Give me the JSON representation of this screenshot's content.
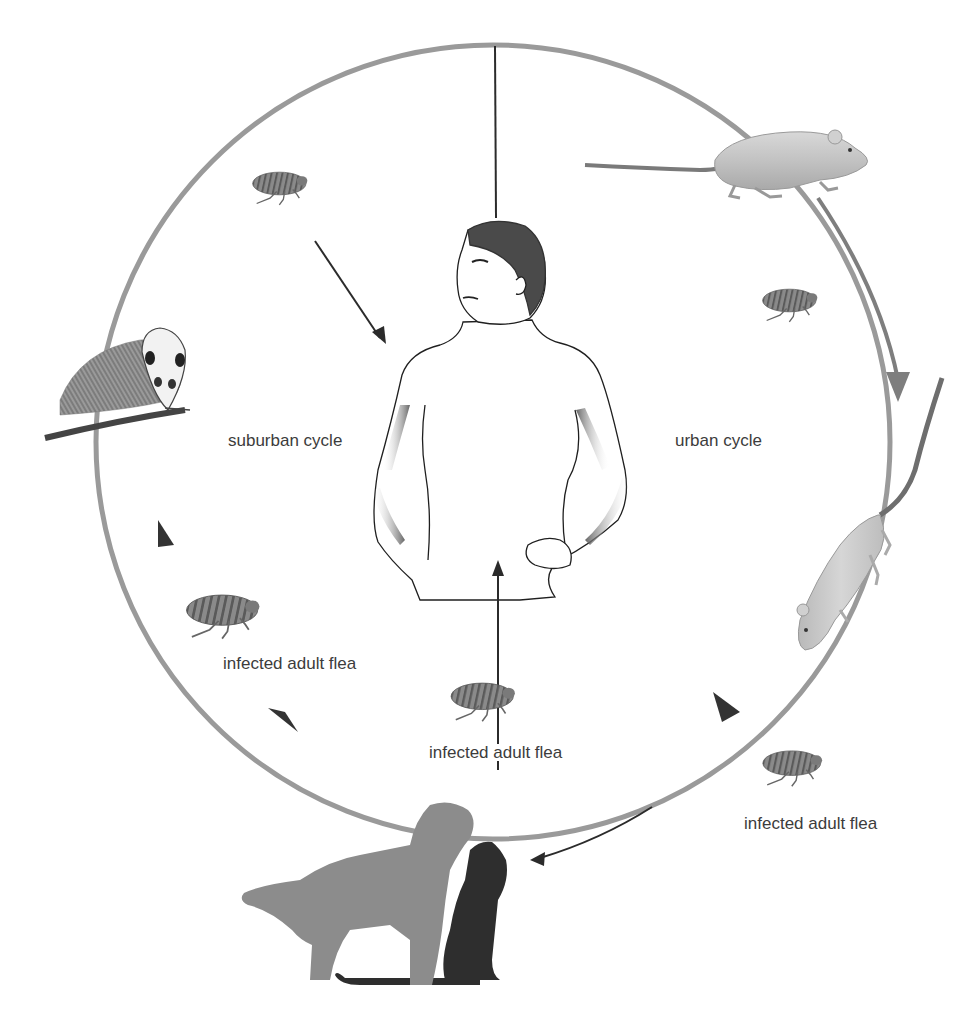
{
  "diagram": {
    "type": "plague transmission cycle",
    "labels": {
      "suburban_cycle": "suburban cycle",
      "urban_cycle": "urban cycle",
      "flea_left": "infected adult flea",
      "flea_center": "infected adult flea",
      "flea_right": "infected adult flea"
    },
    "nodes": [
      {
        "id": "human",
        "name": "human",
        "position": "center"
      },
      {
        "id": "mouse",
        "name": "mouse",
        "position": "top-right"
      },
      {
        "id": "rat",
        "name": "rat",
        "position": "right"
      },
      {
        "id": "opossum",
        "name": "opossum",
        "position": "left"
      },
      {
        "id": "dog",
        "name": "dog",
        "position": "bottom"
      },
      {
        "id": "cat",
        "name": "cat",
        "position": "bottom"
      }
    ],
    "fleas": [
      {
        "id": "flea-top-left",
        "position": "top-left"
      },
      {
        "id": "flea-top-right",
        "position": "upper-right"
      },
      {
        "id": "flea-left",
        "position": "lower-left",
        "label": "infected adult flea"
      },
      {
        "id": "flea-center",
        "position": "bottom-center",
        "label": "infected adult flea"
      },
      {
        "id": "flea-right",
        "position": "lower-right",
        "label": "infected adult flea"
      }
    ],
    "colors": {
      "cycle_ring": "#9a9a9a",
      "arrow_dark": "#2b2b2b",
      "arrowhead": "#3a3a3a",
      "dog": "#8c8c8c",
      "cat": "#2e2e2e",
      "label_text": "#3c3c3c"
    }
  }
}
